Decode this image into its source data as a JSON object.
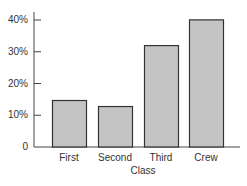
{
  "chart_data": {
    "type": "bar",
    "title": "",
    "xlabel": "Class",
    "ylabel": "",
    "categories": [
      "First",
      "Second",
      "Third",
      "Crew"
    ],
    "values": [
      14.8,
      12.9,
      32.1,
      40.2
    ],
    "value_unit": "%",
    "ylim": [
      0,
      42
    ],
    "yticks": [
      0,
      10,
      20,
      30,
      40
    ],
    "ytick_labels": [
      "0",
      "10%",
      "20%",
      "30%",
      "40%"
    ],
    "grid": false,
    "legend": null,
    "bar_color": "#c4c4c4",
    "bar_edge_color": "#333333"
  }
}
